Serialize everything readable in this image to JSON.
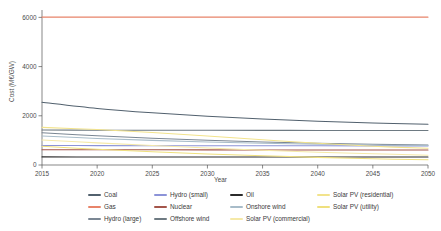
{
  "chart_data": {
    "type": "line",
    "title": "",
    "xlabel": "Year",
    "ylabel": "Cost (M€/GW)",
    "xlim": [
      2015,
      2050
    ],
    "ylim": [
      0,
      6300
    ],
    "xticks": [
      2015,
      2020,
      2025,
      2030,
      2035,
      2040,
      2045,
      2050
    ],
    "yticks": [
      0,
      2000,
      4000,
      6000
    ],
    "grid": false,
    "legend_position": "below-plot",
    "legend_columns": 4,
    "x": [
      2015,
      2020,
      2025,
      2030,
      2035,
      2040,
      2045,
      2050
    ],
    "series": [
      {
        "name": "Coal",
        "color": "#52616e",
        "values": [
          2550,
          2300,
          2120,
          1980,
          1870,
          1780,
          1710,
          1655
        ]
      },
      {
        "name": "Gas",
        "color": "#e8846a",
        "values": [
          6010,
          6010,
          6010,
          6010,
          6010,
          6010,
          6010,
          6010
        ]
      },
      {
        "name": "Hydro (large)",
        "color": "#7b8794",
        "values": [
          1310,
          1190,
          1090,
          1005,
          935,
          880,
          840,
          810
        ]
      },
      {
        "name": "Hydro (small)",
        "color": "#8c93d8",
        "values": [
          790,
          788,
          786,
          784,
          782,
          780,
          778,
          776
        ]
      },
      {
        "name": "Nuclear",
        "color": "#a4554a",
        "values": [
          620,
          618,
          616,
          614,
          612,
          610,
          608,
          606
        ]
      },
      {
        "name": "Offshore wind",
        "color": "#6e7a82",
        "values": [
          1420,
          1415,
          1412,
          1410,
          1408,
          1406,
          1404,
          1402
        ]
      },
      {
        "name": "Oil",
        "color": "#2b2b2b",
        "values": [
          330,
          328,
          327,
          326,
          325,
          324,
          323,
          322
        ]
      },
      {
        "name": "Onshore wind",
        "color": "#a8bcc9",
        "values": [
          1180,
          1080,
          1000,
          935,
          885,
          845,
          815,
          790
        ]
      },
      {
        "name": "Solar PV (commercial)",
        "color": "#f5e9a8",
        "values": [
          1020,
          900,
          790,
          690,
          600,
          520,
          455,
          400
        ]
      },
      {
        "name": "Solar PV (residential)",
        "color": "#f2e38c",
        "values": [
          1530,
          1440,
          1320,
          1180,
          1030,
          880,
          760,
          680
        ]
      },
      {
        "name": "Solar PV (utility)",
        "color": "#efe07e",
        "values": [
          760,
          640,
          540,
          450,
          375,
          310,
          255,
          210
        ]
      }
    ]
  },
  "legend": {
    "items": [
      {
        "label": "Coal"
      },
      {
        "label": "Hydro (small)"
      },
      {
        "label": "Oil"
      },
      {
        "label": "Solar PV (residential)"
      },
      {
        "label": "Gas"
      },
      {
        "label": "Nuclear"
      },
      {
        "label": "Onshore wind"
      },
      {
        "label": "Solar PV (utility)"
      },
      {
        "label": "Hydro (large)"
      },
      {
        "label": "Offshore wind"
      },
      {
        "label": "Solar PV (commercial)"
      },
      {
        "label": ""
      }
    ]
  }
}
